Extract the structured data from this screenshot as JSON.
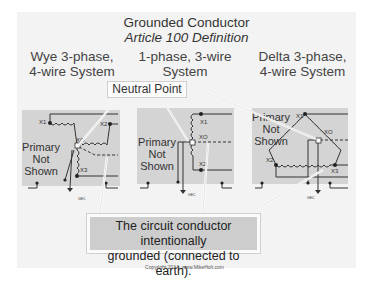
{
  "header": {
    "title": "Grounded Conductor",
    "subtitle": "Article 100 Definition"
  },
  "columns": [
    {
      "title_line1": "Wye 3-phase,",
      "title_line2": "4-wire System",
      "primary_label": [
        "Primary",
        "Not",
        "Shown"
      ],
      "terminals": [
        "X1",
        "X2",
        "XO",
        "X3"
      ],
      "gec_label": "GEC"
    },
    {
      "title_line1": "1-phase, 3-wire",
      "title_line2": "System",
      "primary_label": [
        "Primary",
        "Not",
        "Shown"
      ],
      "terminals": [
        "X1",
        "XO",
        "X2"
      ],
      "gec_label": "GEC"
    },
    {
      "title_line1": "Delta 3-phase,",
      "title_line2": "4-wire System",
      "primary_label": [
        "Primary",
        "Not",
        "Shown"
      ],
      "terminals": [
        "X1",
        "XO",
        "X2",
        "X3"
      ],
      "gec_label": "GEC"
    }
  ],
  "callouts": {
    "neutral_point": "Neutral Point",
    "definition_line1": "The circuit conductor intentionally",
    "definition_line2": "grounded (connected to earth)."
  },
  "footer": {
    "copyright": "Copyright 2014, www.MikeHolt.com"
  },
  "colors": {
    "slide_bg": "#f3f3f3",
    "panel_gray": "#d4d4d4",
    "line": "#333333"
  }
}
